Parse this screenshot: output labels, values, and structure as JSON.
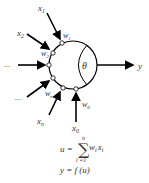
{
  "diagram": {
    "inputs": [
      {
        "label": "x",
        "sub": "1",
        "weight_label": "w",
        "weight_sub": "1"
      },
      {
        "label": "x",
        "sub": "2",
        "weight_label": "w",
        "weight_sub": "2"
      },
      {
        "label": "...",
        "sub": "",
        "weight_label": "",
        "weight_sub": ""
      },
      {
        "label": "...",
        "sub": "",
        "weight_label": "",
        "weight_sub": ""
      },
      {
        "label": "x",
        "sub": "n",
        "weight_label": "w",
        "weight_sub": "n"
      },
      {
        "label": "x",
        "sub": "0",
        "weight_label": "w",
        "weight_sub": "0"
      }
    ],
    "threshold_label": "θ",
    "output_label": "y",
    "formula": {
      "sum_lhs": "u =",
      "sum_symbol": "∑",
      "sum_upper": "n",
      "sum_lower": "i =1",
      "sum_term_w": "w",
      "sum_term_x": "x",
      "sum_index": "i",
      "activation": "y = f (u)"
    },
    "colors": {
      "stroke": "#000000",
      "text": "#333333",
      "background": "#ffffff"
    }
  }
}
